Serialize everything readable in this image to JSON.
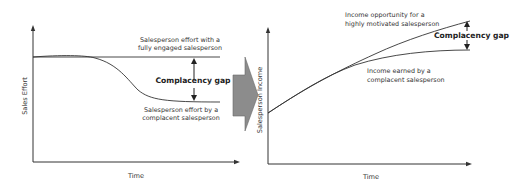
{
  "left_chart": {
    "y_axis_label": "Sales Effort",
    "x_axis_label": "Time",
    "top_line_label": [
      "Salesperson effort with a",
      "fully engaged salesperson"
    ],
    "bottom_line_label": [
      "Salesperson effort by a",
      "complacent salesperson"
    ],
    "gap_label": "Complacency gap"
  },
  "transition_arrow": {
    "icon": "right-arrow-icon",
    "color": "#8c8c8c"
  },
  "right_chart": {
    "y_axis_label": "Salesperson Income",
    "x_axis_label": "Time",
    "top_line_label": [
      "Income opportunity for a",
      "highly motivated salesperson"
    ],
    "bottom_line_label": [
      "Income earned by a",
      "complacent salesperson"
    ],
    "gap_label": "Complacency gap"
  }
}
